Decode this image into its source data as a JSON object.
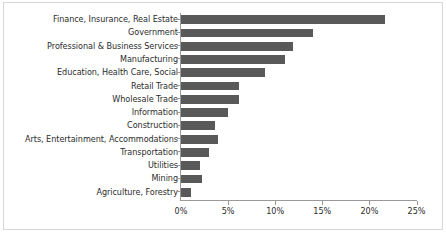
{
  "chart_data": {
    "type": "bar",
    "orientation": "horizontal",
    "title": "",
    "subtitle": "",
    "xlabel": "",
    "ylabel": "",
    "xlim": [
      0,
      25
    ],
    "grid": false,
    "legend": null,
    "bar_color": "#595959",
    "axis_color": "#9a9a9a",
    "text_color": "#2b2b2b",
    "tick_labels": [
      "0%",
      "5%",
      "10%",
      "15%",
      "20%",
      "25%"
    ],
    "tick_values": [
      0,
      5,
      10,
      15,
      20,
      25
    ],
    "value_unit": "%",
    "categories": [
      "Finance, Insurance, Real Estate",
      "Government",
      "Professional & Business Services",
      "Manufacturing",
      "Education, Health Care, Social",
      "Retail Trade",
      "Wholesale Trade",
      "Information",
      "Construction",
      "Arts, Entertainment, Accommodations",
      "Transportation",
      "Utilities",
      "Mining",
      "Agriculture, Forestry"
    ],
    "values": [
      21.7,
      14.0,
      11.9,
      11.0,
      8.9,
      6.2,
      6.2,
      5.0,
      3.6,
      3.9,
      3.0,
      2.0,
      2.2,
      1.1
    ]
  }
}
